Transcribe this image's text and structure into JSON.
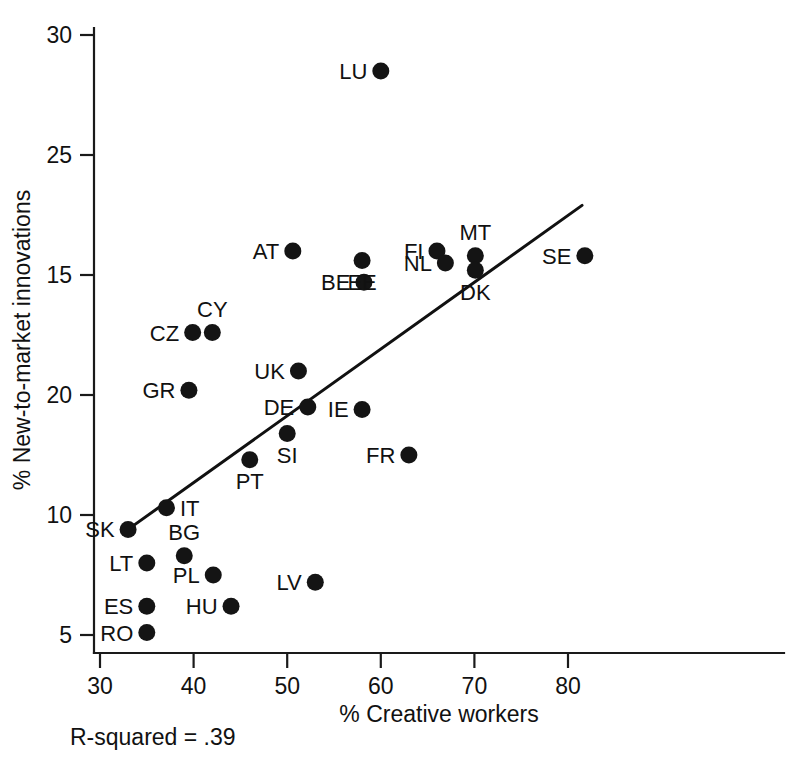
{
  "chart_data": {
    "type": "scatter",
    "title": "",
    "xlabel": "% Creative workers",
    "ylabel": "% New-to-market innovations",
    "xlim": [
      28,
      84
    ],
    "ylim": [
      4,
      31
    ],
    "grid": false,
    "legend": "none",
    "xticks": [
      "30",
      "40",
      "50",
      "60",
      "70",
      "80"
    ],
    "xtick_values": [
      30,
      40,
      50,
      60,
      70,
      80
    ],
    "yticks": [
      "30",
      "25",
      "15",
      "20",
      "10",
      "5"
    ],
    "ytick_values": [
      30,
      25,
      20,
      15,
      10,
      5
    ],
    "ytick_note": "Tick labels as printed top-to-bottom: 30, 25, 15, 20, 10, 5",
    "annotation": "R-squared = .39",
    "r_squared": 0.39,
    "points": [
      {
        "label": "LU",
        "x": 60.0,
        "y": 28.5,
        "label_pos": "left"
      },
      {
        "label": "AT",
        "x": 50.6,
        "y": 21.0,
        "label_pos": "left"
      },
      {
        "label": "FI",
        "x": 66.0,
        "y": 21.0,
        "label_pos": "left"
      },
      {
        "label": "SE",
        "x": 81.8,
        "y": 20.8,
        "label_pos": "left"
      },
      {
        "label": "BE",
        "x": 58.2,
        "y": 19.7,
        "label_pos": "left"
      },
      {
        "label": "GR",
        "x": 39.5,
        "y": 15.2,
        "label_pos": "left"
      },
      {
        "label": "UK",
        "x": 51.2,
        "y": 16.0,
        "label_pos": "left"
      },
      {
        "label": "DE",
        "x": 52.2,
        "y": 14.5,
        "label_pos": "left"
      },
      {
        "label": "IE",
        "x": 58.0,
        "y": 14.4,
        "label_pos": "left"
      },
      {
        "label": "SI",
        "x": 50.0,
        "y": 13.4,
        "label_pos": "below"
      },
      {
        "label": "NL",
        "x": 66.9,
        "y": 20.5,
        "label_pos": "left"
      },
      {
        "label": "MT",
        "x": 70.1,
        "y": 20.8,
        "label_pos": "above"
      },
      {
        "label": "DK",
        "x": 70.1,
        "y": 20.2,
        "label_pos": "below"
      },
      {
        "label": "EE",
        "x": 58.0,
        "y": 20.6,
        "label_pos": "below"
      },
      {
        "label": "CZ",
        "x": 39.9,
        "y": 17.6,
        "label_pos": "left"
      },
      {
        "label": "CY",
        "x": 42.0,
        "y": 17.6,
        "label_pos": "above"
      },
      {
        "label": "PT",
        "x": 46.0,
        "y": 12.3,
        "label_pos": "below"
      },
      {
        "label": "FR",
        "x": 63.0,
        "y": 12.5,
        "label_pos": "left"
      },
      {
        "label": "IT",
        "x": 37.1,
        "y": 10.3,
        "label_pos": "right"
      },
      {
        "label": "SK",
        "x": 33.0,
        "y": 9.4,
        "label_pos": "left"
      },
      {
        "label": "BG",
        "x": 39.0,
        "y": 8.3,
        "label_pos": "above"
      },
      {
        "label": "LT",
        "x": 35.0,
        "y": 8.0,
        "label_pos": "left"
      },
      {
        "label": "PL",
        "x": 42.1,
        "y": 7.5,
        "label_pos": "left"
      },
      {
        "label": "LV",
        "x": 53.0,
        "y": 7.2,
        "label_pos": "left"
      },
      {
        "label": "ES",
        "x": 35.0,
        "y": 6.2,
        "label_pos": "left"
      },
      {
        "label": "HU",
        "x": 44.0,
        "y": 6.2,
        "label_pos": "left"
      },
      {
        "label": "RO",
        "x": 35.0,
        "y": 5.1,
        "label_pos": "left"
      }
    ],
    "trendline": {
      "x0": 33.0,
      "y0": 9.4,
      "x1": 81.5,
      "y1": 22.9
    }
  }
}
